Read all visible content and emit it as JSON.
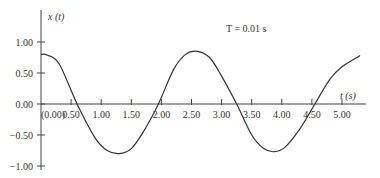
{
  "chart_data": {
    "type": "line",
    "title": "",
    "xlabel": "t (s)",
    "ylabel": "x (t)",
    "annotation": "T = 0.01 s",
    "xlim": [
      0,
      5.3
    ],
    "ylim": [
      -1.0,
      1.0
    ],
    "grid": false,
    "legend": null,
    "x_ticks": [
      "0.00",
      "0.50",
      "1.00",
      "1.50",
      "2.00",
      "2.50",
      "3.00",
      "3.50",
      "4.00",
      "4.50",
      "5.00"
    ],
    "y_ticks": [
      "1.00",
      "0.50",
      "0.00",
      "-0.50",
      "-1.00"
    ],
    "series": [
      {
        "name": "x(t)",
        "x": [
          0.0,
          0.1,
          0.3,
          0.6,
          0.9,
          1.1,
          1.3,
          1.5,
          1.7,
          1.95,
          2.2,
          2.4,
          2.6,
          2.8,
          3.0,
          3.25,
          3.5,
          3.7,
          3.87,
          4.05,
          4.3,
          4.55,
          4.8,
          5.0,
          5.3
        ],
        "y": [
          0.8,
          0.79,
          0.65,
          0.0,
          -0.55,
          -0.75,
          -0.8,
          -0.72,
          -0.45,
          0.0,
          0.55,
          0.8,
          0.85,
          0.75,
          0.45,
          0.0,
          -0.5,
          -0.72,
          -0.77,
          -0.7,
          -0.4,
          0.0,
          0.4,
          0.6,
          0.78
        ]
      }
    ]
  },
  "labels": {
    "ylabel": "x (t)",
    "xlabel": "t (s)",
    "annotation": "T = 0.01 s"
  }
}
